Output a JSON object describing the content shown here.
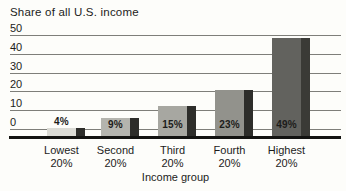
{
  "chart_data": {
    "type": "bar",
    "title": "Share of all U.S. income",
    "xlabel": "Income group",
    "ylabel": "",
    "categories": [
      "Lowest 20%",
      "Second 20%",
      "Third 20%",
      "Fourth 20%",
      "Highest 20%"
    ],
    "category_lines": [
      [
        "Lowest",
        "20%"
      ],
      [
        "Second",
        "20%"
      ],
      [
        "Third",
        "20%"
      ],
      [
        "Fourth",
        "20%"
      ],
      [
        "Highest",
        "20%"
      ]
    ],
    "values": [
      4,
      9,
      15,
      23,
      49
    ],
    "bar_labels": [
      "4%",
      "9%",
      "15%",
      "23%",
      "49%"
    ],
    "yticks": [
      0,
      10,
      20,
      30,
      40,
      50
    ],
    "ylim": [
      0,
      50
    ],
    "grid": true,
    "legend": "none",
    "bar_colors": [
      "#dbdbd5",
      "#b4b4ae",
      "#a7a7a1",
      "#92928c",
      "#62625e"
    ],
    "bar_shadow_colors": [
      "#2d2d2a",
      "#2d2d2a",
      "#2d2d2a",
      "#2d2d2a",
      "#3a3a36"
    ],
    "text_color": "#1c1c1a",
    "gridline_color": "#7e7e79",
    "axis_color": "#131311",
    "background": "#fdfdfa"
  }
}
